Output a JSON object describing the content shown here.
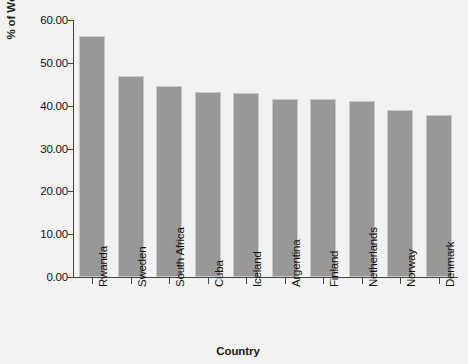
{
  "chart_data": {
    "type": "bar",
    "title": "",
    "xlabel": "Country",
    "ylabel": "% of Women in the parliament",
    "categories": [
      "Rwanda",
      "Sweden",
      "South Africa",
      "Cuba",
      "Iceland",
      "Argentina",
      "Finland",
      "Netherlands",
      "Norway",
      "Denmark"
    ],
    "values": [
      56.3,
      47.0,
      44.5,
      43.2,
      42.9,
      41.6,
      41.5,
      41.0,
      39.0,
      37.9
    ],
    "ylim": [
      0,
      60
    ],
    "yticks": [
      0,
      10,
      20,
      30,
      40,
      50,
      60
    ],
    "ytick_labels": [
      "0.00",
      "10.00",
      "20.00",
      "30.00",
      "40.00",
      "50.00",
      "60.00"
    ],
    "grid": false,
    "legend": null,
    "bar_color": "#989896",
    "bar_edge_color": "#c9c9c7",
    "axis_color": "#444444",
    "background_color": "#f2f2f0"
  }
}
